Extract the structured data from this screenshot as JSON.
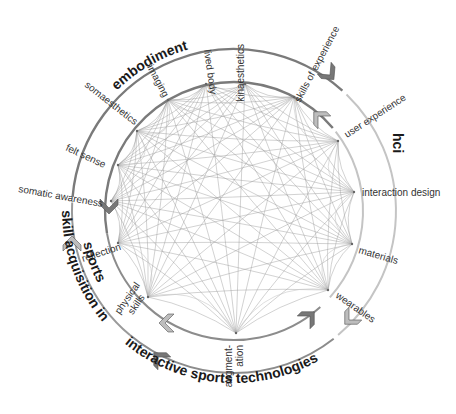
{
  "diagram": {
    "center": [
      234,
      211
    ],
    "inner_radius": 129,
    "outer_radius": 162,
    "colors": {
      "embodiment_ring": "#7a7a7a",
      "hci_ring": "#c4c4c4",
      "sports_tech_ring": "#8c8c8c",
      "skill_ring": "#9a9a9a",
      "edge": "#9a9a9a",
      "arrow_dark": "#777777",
      "arrow_light": "#bdbdbd"
    },
    "groups": [
      {
        "id": "embodiment",
        "label": "embodiment"
      },
      {
        "id": "hci",
        "label": "hci"
      },
      {
        "id": "interactive-sports-technologies",
        "label": "interactive sports technologies"
      },
      {
        "id": "skill-acquisition",
        "label": "skill acquisition in sports",
        "lines": [
          "skill acquisition in",
          "sports"
        ]
      }
    ],
    "nodes": [
      {
        "id": "lived-body",
        "label": "lived body",
        "x": 206,
        "y": 84
      },
      {
        "id": "kinaesthetics",
        "label": "kinaesthetics",
        "x": 245,
        "y": 84
      },
      {
        "id": "skills-of-experience",
        "label": "skills of experience",
        "x": 294,
        "y": 97
      },
      {
        "id": "user-experience",
        "label": "user experience",
        "x": 338,
        "y": 141
      },
      {
        "id": "interaction-design",
        "label": "interaction design",
        "x": 354,
        "y": 192
      },
      {
        "id": "materials",
        "label": "materials",
        "x": 352,
        "y": 244
      },
      {
        "id": "wearables",
        "label": "wearables",
        "x": 328,
        "y": 290
      },
      {
        "id": "augmentation",
        "label": "augment-ation",
        "lines": [
          "augment-",
          "ation"
        ],
        "x": 236,
        "y": 333
      },
      {
        "id": "physical-skills",
        "label": "physical skills",
        "lines": [
          "physical",
          "skills"
        ],
        "x": 148,
        "y": 297
      },
      {
        "id": "reflection",
        "label": "reflection",
        "x": 118,
        "y": 243
      },
      {
        "id": "somatic-awareness",
        "label": "somatic awareness",
        "x": 111,
        "y": 201
      },
      {
        "id": "felt-sense",
        "label": "felt sense",
        "x": 118,
        "y": 165
      },
      {
        "id": "somaesthetics",
        "label": "somaesthetics",
        "x": 137,
        "y": 131
      },
      {
        "id": "imaging",
        "label": "imaging",
        "x": 168,
        "y": 100
      }
    ]
  }
}
